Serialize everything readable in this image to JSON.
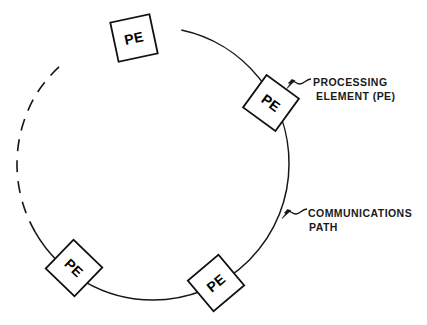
{
  "figure": {
    "type": "ring-network-diagram",
    "background_color": "#ffffff",
    "line_color": "#161616"
  },
  "ring": {
    "center_x": 153,
    "center_y": 164,
    "radius": 136,
    "solid_arc_start_deg": -78,
    "solid_arc_end_deg": 150,
    "dashed_arc_start_deg": 150,
    "dashed_arc_end_deg": 282,
    "dash_pattern": "12 9"
  },
  "nodes": [
    {
      "id": "pe-top",
      "label": "PE",
      "cx": 134,
      "cy": 38,
      "size": 40,
      "rotation_deg": -12
    },
    {
      "id": "pe-right",
      "label": "PE",
      "cx": 271,
      "cy": 103,
      "size": 40,
      "rotation_deg": 36
    },
    {
      "id": "pe-bottom-right",
      "label": "PE",
      "cx": 216,
      "cy": 283,
      "size": 40,
      "rotation_deg": -40
    },
    {
      "id": "pe-bottom-left",
      "label": "PE",
      "cx": 74,
      "cy": 268,
      "size": 40,
      "rotation_deg": 44
    }
  ],
  "callouts": {
    "processing_element": {
      "line1": "PROCESSING",
      "line2": "ELEMENT (PE)",
      "target_x": 288,
      "target_y": 88
    },
    "communications_path": {
      "line1": "COMMUNICATIONS",
      "line2": "PATH",
      "target_x": 283,
      "target_y": 216
    }
  }
}
